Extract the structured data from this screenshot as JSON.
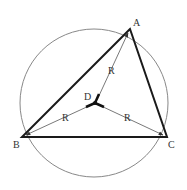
{
  "diagram": {
    "type": "circumscribed-triangle",
    "points": {
      "A": {
        "label": "A",
        "x": 130,
        "y": 29
      },
      "B": {
        "label": "B",
        "x": 22,
        "y": 137
      },
      "C": {
        "label": "C",
        "x": 167,
        "y": 137
      },
      "D": {
        "label": "D",
        "x": 95,
        "y": 103
      }
    },
    "circle": {
      "cx": 94,
      "cy": 103,
      "r": 74
    },
    "radius_labels": [
      "R",
      "R",
      "R"
    ],
    "colors": {
      "triangle": "#1a1a1a",
      "circle": "#888888",
      "radius": "#555555",
      "text": "#333333"
    }
  }
}
